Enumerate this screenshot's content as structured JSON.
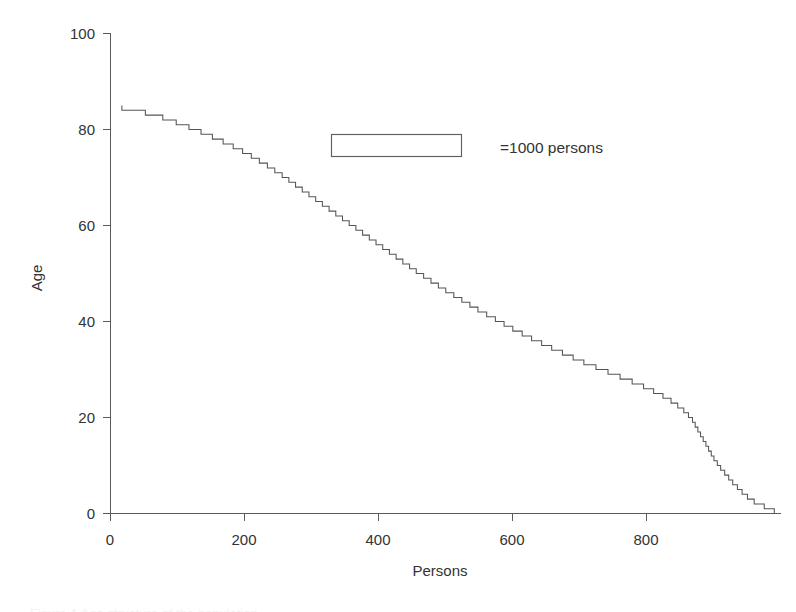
{
  "figure": {
    "background_color": "#ffffff",
    "line_color": "#555555",
    "axis_color": "#5a5a5a",
    "caption_sliver_text": "Figure 1  Age structure of the population"
  },
  "legend": {
    "label": "=1000 persons",
    "swatch_name": "rectangle-outline"
  },
  "axis": {
    "y_title": "Age",
    "x_title": "Persons",
    "y_ticks": [
      "0",
      "20",
      "40",
      "60",
      "80",
      "100"
    ],
    "x_ticks": [
      "0",
      "200",
      "400",
      "600",
      "800"
    ]
  },
  "chart_data": {
    "type": "bar",
    "orientation": "horizontal",
    "title": "",
    "subtitle": "",
    "xlabel": "Persons",
    "ylabel": "Age",
    "xlim": [
      0,
      1000
    ],
    "ylim": [
      0,
      100
    ],
    "xticks": [
      0,
      200,
      400,
      600,
      800
    ],
    "yticks": [
      0,
      20,
      40,
      60,
      80,
      100
    ],
    "grid": false,
    "legend_position": "upper-center",
    "annotations": [
      "=1000 persons"
    ],
    "note": "Outline-only step profile: for each age (year) the horizontal extent is the number of persons of that age. Drawn as a single staircase outline rather than filled bars.",
    "categories": [
      0,
      1,
      2,
      3,
      4,
      5,
      6,
      7,
      8,
      9,
      10,
      11,
      12,
      13,
      14,
      15,
      16,
      17,
      18,
      19,
      20,
      21,
      22,
      23,
      24,
      25,
      26,
      27,
      28,
      29,
      30,
      31,
      32,
      33,
      34,
      35,
      36,
      37,
      38,
      39,
      40,
      41,
      42,
      43,
      44,
      45,
      46,
      47,
      48,
      49,
      50,
      51,
      52,
      53,
      54,
      55,
      56,
      57,
      58,
      59,
      60,
      61,
      62,
      63,
      64,
      65,
      66,
      67,
      68,
      69,
      70,
      71,
      72,
      73,
      74,
      75,
      76,
      77,
      78,
      79,
      80,
      81,
      82,
      83,
      84
    ],
    "values": [
      990,
      975,
      960,
      950,
      942,
      935,
      928,
      922,
      916,
      910,
      905,
      900,
      896,
      892,
      888,
      884,
      880,
      876,
      872,
      868,
      862,
      855,
      846,
      836,
      824,
      810,
      795,
      778,
      760,
      742,
      724,
      706,
      690,
      674,
      658,
      643,
      628,
      614,
      600,
      587,
      574,
      561,
      548,
      536,
      524,
      512,
      500,
      489,
      478,
      467,
      456,
      446,
      436,
      426,
      416,
      406,
      396,
      386,
      376,
      366,
      356,
      346,
      336,
      326,
      316,
      306,
      296,
      286,
      276,
      266,
      256,
      245,
      234,
      222,
      210,
      197,
      183,
      168,
      152,
      135,
      117,
      98,
      78,
      52,
      17
    ],
    "series": [
      {
        "name": "Persons by age",
        "values": [
          990,
          975,
          960,
          950,
          942,
          935,
          928,
          922,
          916,
          910,
          905,
          900,
          896,
          892,
          888,
          884,
          880,
          876,
          872,
          868,
          862,
          855,
          846,
          836,
          824,
          810,
          795,
          778,
          760,
          742,
          724,
          706,
          690,
          674,
          658,
          643,
          628,
          614,
          600,
          587,
          574,
          561,
          548,
          536,
          524,
          512,
          500,
          489,
          478,
          467,
          456,
          446,
          436,
          426,
          416,
          406,
          396,
          386,
          376,
          366,
          356,
          346,
          336,
          326,
          316,
          306,
          296,
          286,
          276,
          266,
          256,
          245,
          234,
          222,
          210,
          197,
          183,
          168,
          152,
          135,
          117,
          98,
          78,
          52,
          17
        ]
      }
    ]
  }
}
